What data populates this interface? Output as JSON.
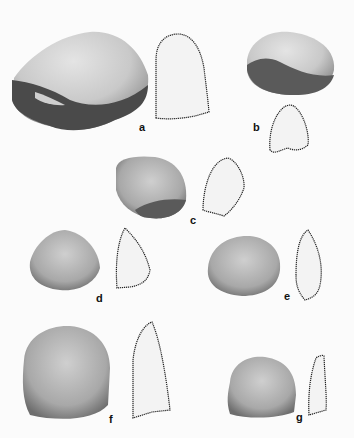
{
  "figure": {
    "type": "artifact plate",
    "specimens": [
      {
        "id": "a",
        "label": "a"
      },
      {
        "id": "b",
        "label": "b"
      },
      {
        "id": "c",
        "label": "c"
      },
      {
        "id": "d",
        "label": "d"
      },
      {
        "id": "e",
        "label": "e"
      },
      {
        "id": "f",
        "label": "f"
      },
      {
        "id": "g",
        "label": "g"
      }
    ]
  }
}
